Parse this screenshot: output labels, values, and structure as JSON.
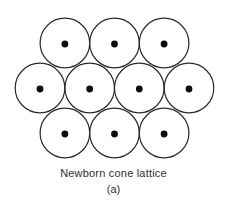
{
  "figure": {
    "caption": "Newborn cone lattice",
    "sublabel": "(a)"
  },
  "lattice": {
    "description": "hexagonally packed circles each with a center dot",
    "circle_radius": 24.8,
    "dot_radius": 3.4,
    "stroke_color": "#2b2b2b",
    "stroke_width": 1.2,
    "dot_color": "#0d0d0d",
    "fill_color": "#ffffff",
    "background_color": "#ffffff",
    "rows": [
      {
        "y": 43,
        "xs": [
          64.9,
          114.5,
          164.1
        ]
      },
      {
        "y": 88,
        "xs": [
          40.0,
          89.7,
          139.3,
          189.0
        ]
      },
      {
        "y": 133,
        "xs": [
          64.9,
          114.5,
          164.1
        ]
      }
    ]
  }
}
